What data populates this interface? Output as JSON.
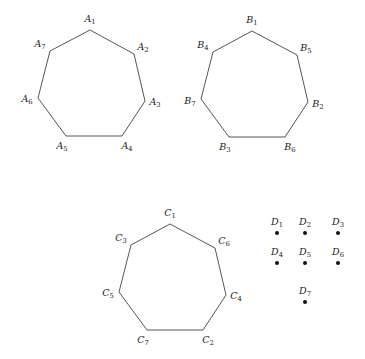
{
  "figure": {
    "background_color": "#ffffff",
    "stroke_color": "#555555",
    "dot_color": "#111111",
    "shapes": [
      {
        "id": "heptagon-a",
        "kind": "heptagon",
        "prefix": "A",
        "vertices": [
          {
            "label": "A",
            "sub": "1",
            "px": 90,
            "py": 30,
            "lx": 90,
            "ly": 22
          },
          {
            "label": "A",
            "sub": "2",
            "px": 134,
            "py": 54,
            "lx": 143,
            "ly": 50
          },
          {
            "label": "A",
            "sub": "3",
            "px": 145,
            "py": 101,
            "lx": 155,
            "ly": 105
          },
          {
            "label": "A",
            "sub": "4",
            "px": 122,
            "py": 136,
            "lx": 127,
            "ly": 149
          },
          {
            "label": "A",
            "sub": "5",
            "px": 66,
            "py": 136,
            "lx": 62,
            "ly": 149
          },
          {
            "label": "A",
            "sub": "6",
            "px": 38,
            "py": 98,
            "lx": 27,
            "ly": 102
          },
          {
            "label": "A",
            "sub": "7",
            "px": 50,
            "py": 51,
            "lx": 40,
            "ly": 47
          }
        ]
      },
      {
        "id": "heptagon-b",
        "kind": "heptagon",
        "prefix": "B",
        "vertices": [
          {
            "label": "B",
            "sub": "1",
            "px": 252,
            "py": 31,
            "lx": 252,
            "ly": 23
          },
          {
            "label": "B",
            "sub": "5",
            "px": 297,
            "py": 55,
            "lx": 306,
            "ly": 51
          },
          {
            "label": "B",
            "sub": "2",
            "px": 308,
            "py": 102,
            "lx": 318,
            "ly": 107
          },
          {
            "label": "B",
            "sub": "6",
            "px": 285,
            "py": 137,
            "lx": 290,
            "ly": 150
          },
          {
            "label": "B",
            "sub": "3",
            "px": 229,
            "py": 137,
            "lx": 225,
            "ly": 150
          },
          {
            "label": "B",
            "sub": "7",
            "px": 201,
            "py": 99,
            "lx": 190,
            "ly": 104
          },
          {
            "label": "B",
            "sub": "4",
            "px": 213,
            "py": 52,
            "lx": 203,
            "ly": 48
          }
        ]
      },
      {
        "id": "heptagon-c",
        "kind": "heptagon",
        "prefix": "C",
        "vertices": [
          {
            "label": "C",
            "sub": "1",
            "px": 170,
            "py": 224,
            "lx": 170,
            "ly": 216
          },
          {
            "label": "C",
            "sub": "6",
            "px": 215,
            "py": 248,
            "lx": 224,
            "ly": 244
          },
          {
            "label": "C",
            "sub": "4",
            "px": 226,
            "py": 295,
            "lx": 236,
            "ly": 299
          },
          {
            "label": "C",
            "sub": "2",
            "px": 203,
            "py": 330,
            "lx": 208,
            "ly": 343
          },
          {
            "label": "C",
            "sub": "7",
            "px": 147,
            "py": 330,
            "lx": 143,
            "ly": 343
          },
          {
            "label": "C",
            "sub": "5",
            "px": 119,
            "py": 292,
            "lx": 108,
            "ly": 296
          },
          {
            "label": "C",
            "sub": "3",
            "px": 131,
            "py": 245,
            "lx": 121,
            "ly": 241
          }
        ]
      }
    ],
    "points": [
      {
        "label": "D",
        "sub": "1",
        "px": 277,
        "py": 233,
        "lx": 277,
        "ly": 225
      },
      {
        "label": "D",
        "sub": "2",
        "px": 305,
        "py": 233,
        "lx": 305,
        "ly": 225
      },
      {
        "label": "D",
        "sub": "3",
        "px": 338,
        "py": 233,
        "lx": 338,
        "ly": 225
      },
      {
        "label": "D",
        "sub": "4",
        "px": 277,
        "py": 263,
        "lx": 277,
        "ly": 255
      },
      {
        "label": "D",
        "sub": "5",
        "px": 305,
        "py": 263,
        "lx": 305,
        "ly": 255
      },
      {
        "label": "D",
        "sub": "6",
        "px": 338,
        "py": 263,
        "lx": 338,
        "ly": 255
      },
      {
        "label": "D",
        "sub": "7",
        "px": 305,
        "py": 302,
        "lx": 305,
        "ly": 294
      }
    ]
  }
}
